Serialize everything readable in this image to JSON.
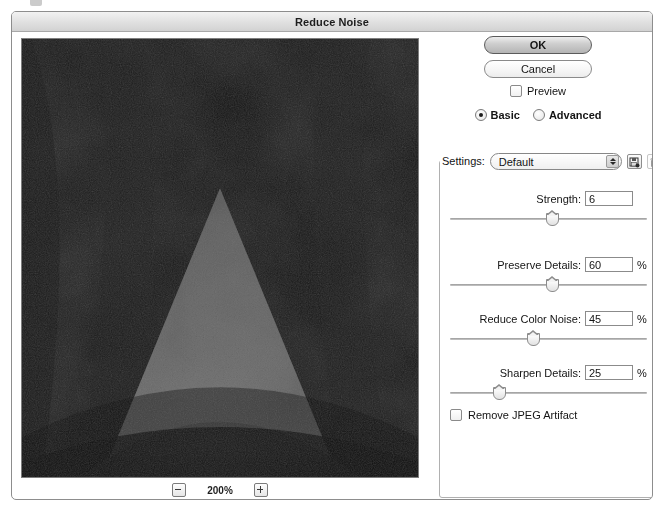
{
  "window": {
    "title": "Reduce Noise"
  },
  "buttons": {
    "ok": "OK",
    "cancel": "Cancel"
  },
  "preview_checkbox": {
    "label": "Preview",
    "checked": false
  },
  "mode": {
    "basic_label": "Basic",
    "advanced_label": "Advanced",
    "selected": "Basic"
  },
  "settings": {
    "label": "Settings:",
    "value": "Default",
    "options": [
      "Default"
    ],
    "save_icon": "save-preset-icon",
    "delete_icon": "trash-icon"
  },
  "sliders": [
    {
      "label": "Strength:",
      "value": "6",
      "unit": "",
      "percent_of_track": 52
    },
    {
      "label": "Preserve Details:",
      "value": "60",
      "unit": "%",
      "percent_of_track": 52
    },
    {
      "label": "Reduce Color Noise:",
      "value": "45",
      "unit": "%",
      "percent_of_track": 42
    },
    {
      "label": "Sharpen Details:",
      "value": "25",
      "unit": "%",
      "percent_of_track": 25
    }
  ],
  "jpeg_artifact": {
    "label": "Remove JPEG Artifact",
    "checked": false
  },
  "zoom": {
    "level": "200%",
    "zoom_out_icon": "minus-icon",
    "zoom_in_icon": "plus-icon"
  },
  "preview_image": {
    "description": "noisy grayscale photo preview"
  },
  "colors": {
    "titlebar": "#e3e3e3",
    "dialog_border": "#8d8d8d",
    "text": "#141414"
  }
}
